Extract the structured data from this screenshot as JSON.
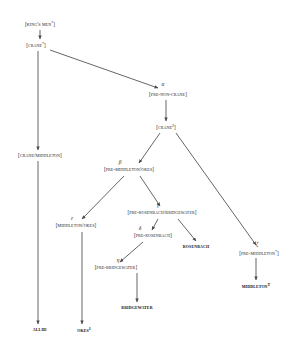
{
  "diagram": {
    "type": "stemma",
    "width": 289,
    "height": 346,
    "line_color": "#4a4a4a",
    "text_color": "#232323"
  },
  "nodes": [
    {
      "id": "kings-men",
      "label": "[King's Men",
      "sup": "*",
      "tail": "]",
      "kind": "hypothetical",
      "x": 40,
      "y": 24
    },
    {
      "id": "crane-1",
      "label": "[Crane",
      "sup": "*",
      "tail": "]",
      "kind": "hypothetical",
      "x": 36,
      "y": 45
    },
    {
      "id": "pre-non-crane",
      "label": "[Pre-Non-Crane",
      "sup": "",
      "tail": "]",
      "kind": "hypothetical",
      "x": 168,
      "y": 95
    },
    {
      "id": "crane-2",
      "label": "[Crane",
      "sup": "2",
      "tail": "]",
      "kind": "hypothetical",
      "x": 166,
      "y": 127
    },
    {
      "id": "crane-middleton",
      "label": "[Crane/Middleton",
      "sup": "",
      "tail": "]",
      "kind": "hypothetical",
      "x": 40,
      "y": 156
    },
    {
      "id": "pre-middleton-okes",
      "label": "[Pre-Middleton/Okes",
      "sup": "",
      "tail": "]",
      "kind": "hypothetical",
      "x": 129,
      "y": 170
    },
    {
      "id": "middleton-okes",
      "label": "[Middleton/Okes",
      "sup": "",
      "tail": "]",
      "kind": "hypothetical",
      "x": 76,
      "y": 226
    },
    {
      "id": "pre-ros-bridge",
      "label": "[Pre-Rosenbach/Bridgewater",
      "sup": "",
      "tail": "]",
      "kind": "hypothetical",
      "x": 162,
      "y": 213
    },
    {
      "id": "pre-rosenbach",
      "label": "[Pre-Rosenbach",
      "sup": "",
      "tail": "]",
      "kind": "hypothetical",
      "x": 153,
      "y": 236
    },
    {
      "id": "rosenbach",
      "label": "Rosenbach",
      "sup": "",
      "tail": "",
      "kind": "extant",
      "x": 196,
      "y": 247
    },
    {
      "id": "pre-middleton",
      "label": "[Pre-Middleton",
      "sup": "*",
      "tail": "]",
      "kind": "hypothetical",
      "x": 259,
      "y": 253
    },
    {
      "id": "pre-bridgewater",
      "label": "[Pre-Bridgewater",
      "sup": "",
      "tail": "]",
      "kind": "hypothetical",
      "x": 116,
      "y": 268
    },
    {
      "id": "middleton",
      "label": "Middleton",
      "sup": "T",
      "tail": "",
      "kind": "extant",
      "x": 256,
      "y": 286
    },
    {
      "id": "bridgewater",
      "label": "Bridgewater",
      "sup": "",
      "tail": "",
      "kind": "extant",
      "x": 137,
      "y": 308
    },
    {
      "id": "allde",
      "label": "Allde",
      "sup": "",
      "tail": "",
      "kind": "extant",
      "x": 40,
      "y": 330
    },
    {
      "id": "okes-1",
      "label": "Okes",
      "sup": "1",
      "tail": "",
      "kind": "extant",
      "x": 84,
      "y": 330
    }
  ],
  "edge_labels": [
    {
      "id": "alpha",
      "glyph": "α",
      "x": 163,
      "y": 85
    },
    {
      "id": "beta",
      "glyph": "β",
      "x": 120,
      "y": 163
    },
    {
      "id": "epsilon",
      "glyph": "ε",
      "x": 72,
      "y": 219
    },
    {
      "id": "gamma",
      "glyph": "γ",
      "x": 158,
      "y": 206
    },
    {
      "id": "delta",
      "glyph": "δ",
      "x": 140,
      "y": 229
    },
    {
      "id": "zeta",
      "glyph": "ζ",
      "x": 257,
      "y": 245
    },
    {
      "id": "eta",
      "glyph": "η",
      "x": 118,
      "y": 261
    }
  ],
  "edges": [
    {
      "from": "kings-men",
      "to": "crane-1",
      "x1": 40,
      "y1": 30,
      "x2": 40,
      "y2": 39,
      "arrow": true
    },
    {
      "from": "crane-1",
      "to": "pre-non-crane",
      "x1": 50,
      "y1": 50,
      "x2": 158,
      "y2": 88,
      "arrow": true
    },
    {
      "from": "crane-1",
      "to": "crane-middleton",
      "x1": 38,
      "y1": 51,
      "x2": 38,
      "y2": 150,
      "arrow": true
    },
    {
      "from": "pre-non-crane",
      "to": "crane-2",
      "x1": 166,
      "y1": 100,
      "x2": 166,
      "y2": 121,
      "arrow": true
    },
    {
      "from": "crane-middleton",
      "to": "allde",
      "x1": 38,
      "y1": 161,
      "x2": 38,
      "y2": 324,
      "arrow": true
    },
    {
      "from": "crane-2",
      "to": "pre-middleton-okes",
      "x1": 160,
      "y1": 133,
      "x2": 139,
      "y2": 163,
      "arrow": true
    },
    {
      "from": "crane-2",
      "to": "pre-middleton",
      "x1": 176,
      "y1": 133,
      "x2": 256,
      "y2": 245,
      "arrow": true
    },
    {
      "from": "pre-middleton-okes",
      "to": "middleton-okes",
      "x1": 124,
      "y1": 176,
      "x2": 82,
      "y2": 219,
      "arrow": true
    },
    {
      "from": "pre-middleton-okes",
      "to": "pre-ros-bridge",
      "x1": 140,
      "y1": 176,
      "x2": 160,
      "y2": 206,
      "arrow": true
    },
    {
      "from": "middleton-okes",
      "to": "okes-1",
      "x1": 82,
      "y1": 232,
      "x2": 82,
      "y2": 324,
      "arrow": true
    },
    {
      "from": "pre-ros-bridge",
      "to": "pre-rosenbach",
      "x1": 158,
      "y1": 219,
      "x2": 152,
      "y2": 230,
      "arrow": true
    },
    {
      "from": "pre-ros-bridge",
      "to": "rosenbach",
      "x1": 178,
      "y1": 219,
      "x2": 196,
      "y2": 241,
      "arrow": true
    },
    {
      "from": "pre-rosenbach",
      "to": "pre-bridgewater",
      "x1": 143,
      "y1": 242,
      "x2": 120,
      "y2": 262,
      "arrow": true
    },
    {
      "from": "pre-bridgewater",
      "to": "bridgewater",
      "x1": 137,
      "y1": 273,
      "x2": 137,
      "y2": 302,
      "arrow": true
    },
    {
      "from": "pre-middleton",
      "to": "middleton",
      "x1": 256,
      "y1": 258,
      "x2": 256,
      "y2": 280,
      "arrow": true
    }
  ]
}
